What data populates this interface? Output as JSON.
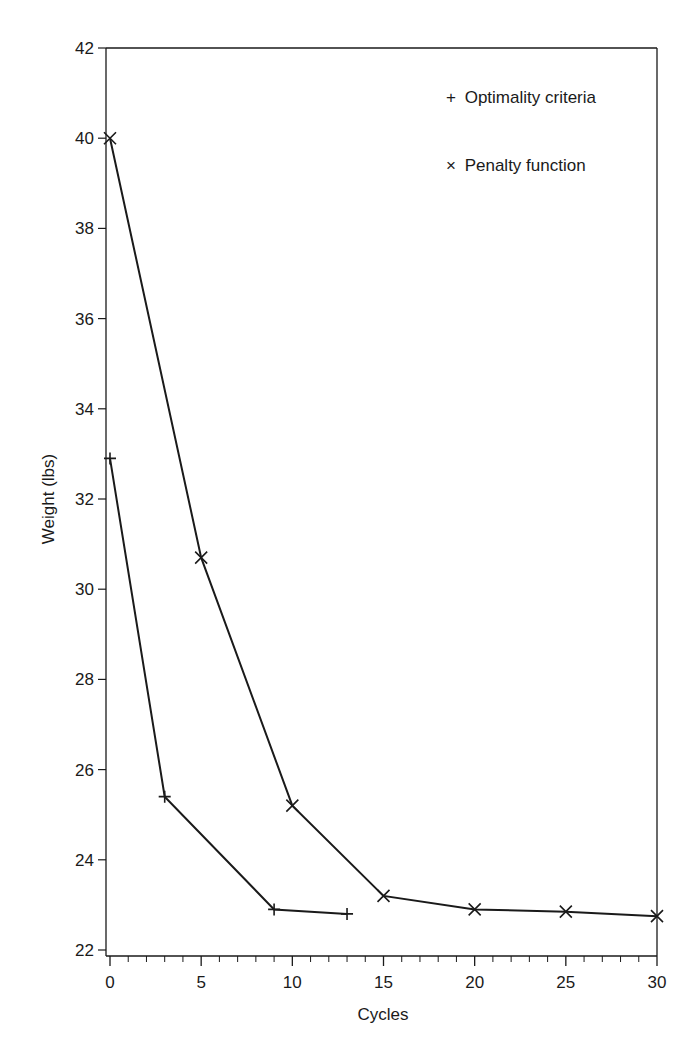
{
  "chart_data": {
    "type": "line",
    "title": "",
    "xlabel": "Cycles",
    "ylabel": "Weight (lbs)",
    "xlim": [
      0,
      30
    ],
    "ylim": [
      22,
      42
    ],
    "x_ticks": [
      0,
      5,
      10,
      15,
      20,
      25,
      30
    ],
    "y_ticks": [
      22,
      24,
      26,
      28,
      30,
      32,
      34,
      36,
      38,
      40,
      42
    ],
    "x_minor_step": 1,
    "grid": false,
    "legend_position": "upper right",
    "series": [
      {
        "name": "Optimality criteria",
        "marker": "+",
        "x": [
          0,
          3,
          9,
          13
        ],
        "y": [
          32.9,
          25.4,
          22.9,
          22.8
        ]
      },
      {
        "name": "Penalty function",
        "marker": "x",
        "x": [
          0,
          5,
          10,
          15,
          20,
          25,
          30
        ],
        "y": [
          40.0,
          30.7,
          25.2,
          23.2,
          22.9,
          22.85,
          22.75
        ]
      }
    ]
  },
  "legend": {
    "items": [
      {
        "symbol": "+",
        "label": "Optimality criteria"
      },
      {
        "symbol": "×",
        "label": "Penalty function"
      }
    ]
  },
  "colors": {
    "line": "#1a1a1a",
    "background": "#ffffff"
  }
}
